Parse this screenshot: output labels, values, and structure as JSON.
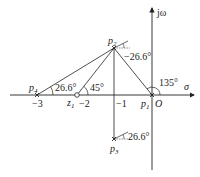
{
  "diagram": {
    "type": "s-plane pole-zero angle diagram",
    "axes": {
      "real_label": "σ",
      "imag_label": "jω",
      "origin_label": "O",
      "ticks": [
        {
          "value": -3,
          "label": "−3"
        },
        {
          "value": -2,
          "label": "−2"
        },
        {
          "value": -1,
          "label": "−1"
        }
      ]
    },
    "poles": [
      {
        "id": "p1",
        "label": "p",
        "sub": "1",
        "re": 0,
        "im": 0
      },
      {
        "id": "p2",
        "label": "p",
        "sub": "2",
        "re": -1,
        "im": 1
      },
      {
        "id": "p3",
        "label": "p",
        "sub": "3",
        "re": -1,
        "im": -1
      },
      {
        "id": "p4",
        "label": "p",
        "sub": "4",
        "re": -3,
        "im": 0
      }
    ],
    "zeros": [
      {
        "id": "z1",
        "label": "z",
        "sub": "1",
        "re": -2,
        "im": 0
      }
    ],
    "angles": {
      "p4_to_p2": "26.6°",
      "z1_to_p2": "45°",
      "p1_to_p2": "135°",
      "p2_departure": "−26.6°",
      "p3_departure": "26.6°"
    }
  }
}
